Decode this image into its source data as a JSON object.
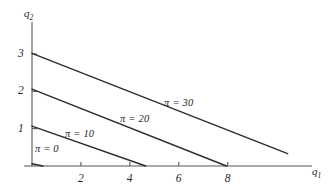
{
  "figure": {
    "background_color": "#ffffff",
    "line_color": "#2b2b2b",
    "axis_color": "#555555",
    "text_color": "#262626"
  },
  "axes": {
    "y_title": "q",
    "y_title_sub": "2",
    "x_title": "q",
    "x_title_sub": "1"
  },
  "chart_data": {
    "type": "line",
    "title": "",
    "xlabel": "q1",
    "ylabel": "q2",
    "xlim": [
      0,
      11.2
    ],
    "ylim": [
      0,
      3.75
    ],
    "grid": false,
    "legend": "inline-annotations",
    "x_ticks": [
      2,
      4,
      6,
      8
    ],
    "x_tick_labels": [
      "2",
      "4",
      "6",
      "8"
    ],
    "y_ticks": [
      1,
      2,
      3
    ],
    "y_tick_labels": [
      "1",
      "2",
      "3"
    ],
    "series": [
      {
        "name": "pi = 0",
        "label": "π = 0",
        "x": [
          0,
          0.45
        ],
        "y": [
          0.06,
          0.0
        ],
        "label_x": 0.12,
        "label_y": 0.42
      },
      {
        "name": "pi = 10",
        "label": "π = 10",
        "x": [
          0,
          4.65
        ],
        "y": [
          1.07,
          0.0
        ],
        "label_x": 1.35,
        "label_y": 0.82
      },
      {
        "name": "pi = 20",
        "label": "π = 20",
        "x": [
          0,
          7.95
        ],
        "y": [
          2.06,
          0.0
        ],
        "label_x": 3.6,
        "label_y": 1.24
      },
      {
        "name": "pi = 30",
        "label": "π = 30",
        "x": [
          0,
          10.45
        ],
        "y": [
          3.02,
          0.33
        ],
        "label_x": 5.4,
        "label_y": 1.65
      }
    ]
  }
}
